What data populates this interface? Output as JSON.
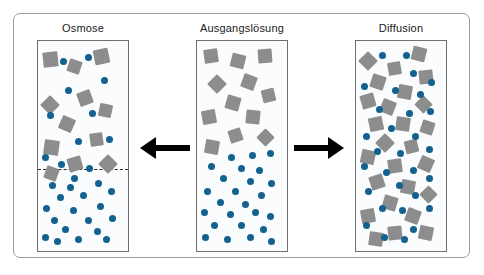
{
  "diagram": {
    "title_visible": false,
    "colors": {
      "solute_square": "#8d8d8d",
      "solvent_dot": "#12618f",
      "arrow": "#000000",
      "vessel_border": "#6f6f6f",
      "frame_border": "#9a9a9a",
      "vessel_fill": "#fbfcfd",
      "membrane": "#2b2b2b"
    },
    "panels": [
      {
        "id": "osmose",
        "label": "Osmose",
        "has_membrane": true,
        "membrane_y_pct": 61,
        "squares": [
          {
            "x": 6,
            "y": 5,
            "s": 15,
            "r": -6
          },
          {
            "x": 33,
            "y": 9,
            "s": 13,
            "r": 18
          },
          {
            "x": 62,
            "y": 4,
            "s": 15,
            "r": -12
          },
          {
            "x": 5,
            "y": 27,
            "s": 14,
            "r": 45
          },
          {
            "x": 44,
            "y": 24,
            "s": 14,
            "r": -20
          },
          {
            "x": 68,
            "y": 30,
            "s": 13,
            "r": 12
          },
          {
            "x": 24,
            "y": 36,
            "s": 14,
            "r": 24
          },
          {
            "x": 58,
            "y": 44,
            "s": 13,
            "r": -8
          },
          {
            "x": 7,
            "y": 47,
            "s": 15,
            "r": 8
          },
          {
            "x": 33,
            "y": 55,
            "s": 14,
            "r": -16
          },
          {
            "x": 70,
            "y": 55,
            "s": 14,
            "r": 45
          },
          {
            "x": 8,
            "y": 60,
            "s": 13,
            "r": 20
          }
        ],
        "dots": [
          {
            "x": 24,
            "y": 8,
            "s": 7
          },
          {
            "x": 52,
            "y": 6,
            "s": 7
          },
          {
            "x": 70,
            "y": 17,
            "s": 7
          },
          {
            "x": 30,
            "y": 22,
            "s": 7
          },
          {
            "x": 10,
            "y": 34,
            "s": 7
          },
          {
            "x": 57,
            "y": 33,
            "s": 7
          },
          {
            "x": 41,
            "y": 46,
            "s": 7
          },
          {
            "x": 76,
            "y": 45,
            "s": 7
          },
          {
            "x": 4,
            "y": 54,
            "s": 7
          },
          {
            "x": 22,
            "y": 57,
            "s": 7
          },
          {
            "x": 53,
            "y": 59,
            "s": 7
          },
          {
            "x": 37,
            "y": 64,
            "s": 7
          },
          {
            "x": 12,
            "y": 67,
            "s": 7
          },
          {
            "x": 32,
            "y": 68,
            "s": 7
          },
          {
            "x": 63,
            "y": 66,
            "s": 7
          },
          {
            "x": 78,
            "y": 70,
            "s": 7
          },
          {
            "x": 21,
            "y": 73,
            "s": 7
          },
          {
            "x": 47,
            "y": 72,
            "s": 7
          },
          {
            "x": 6,
            "y": 78,
            "s": 7
          },
          {
            "x": 36,
            "y": 79,
            "s": 7
          },
          {
            "x": 66,
            "y": 77,
            "s": 7
          },
          {
            "x": 14,
            "y": 84,
            "s": 7
          },
          {
            "x": 52,
            "y": 84,
            "s": 7
          },
          {
            "x": 79,
            "y": 83,
            "s": 7
          },
          {
            "x": 27,
            "y": 88,
            "s": 7
          },
          {
            "x": 62,
            "y": 89,
            "s": 7
          },
          {
            "x": 4,
            "y": 92,
            "s": 7
          },
          {
            "x": 41,
            "y": 93,
            "s": 7
          },
          {
            "x": 72,
            "y": 93,
            "s": 7
          },
          {
            "x": 18,
            "y": 94,
            "s": 7
          }
        ]
      },
      {
        "id": "ausgangsloesung",
        "label": "Ausgangslösung",
        "has_membrane": false,
        "membrane_y_pct": 0,
        "squares": [
          {
            "x": 8,
            "y": 4,
            "s": 14,
            "r": -8
          },
          {
            "x": 38,
            "y": 6,
            "s": 14,
            "r": 14
          },
          {
            "x": 68,
            "y": 4,
            "s": 14,
            "r": -4
          },
          {
            "x": 14,
            "y": 17,
            "s": 14,
            "r": 45
          },
          {
            "x": 50,
            "y": 16,
            "s": 14,
            "r": 20
          },
          {
            "x": 72,
            "y": 23,
            "s": 13,
            "r": -14
          },
          {
            "x": 32,
            "y": 26,
            "s": 14,
            "r": 16
          },
          {
            "x": 6,
            "y": 33,
            "s": 14,
            "r": -10
          },
          {
            "x": 54,
            "y": 33,
            "s": 14,
            "r": 6
          },
          {
            "x": 36,
            "y": 42,
            "s": 13,
            "r": -18
          },
          {
            "x": 69,
            "y": 43,
            "s": 13,
            "r": 45
          },
          {
            "x": 9,
            "y": 47,
            "s": 14,
            "r": 10
          }
        ],
        "dots": [
          {
            "x": 34,
            "y": 54,
            "s": 7
          },
          {
            "x": 58,
            "y": 53,
            "s": 7
          },
          {
            "x": 78,
            "y": 52,
            "s": 7
          },
          {
            "x": 12,
            "y": 58,
            "s": 7
          },
          {
            "x": 45,
            "y": 59,
            "s": 7
          },
          {
            "x": 66,
            "y": 60,
            "s": 7
          },
          {
            "x": 25,
            "y": 64,
            "s": 7
          },
          {
            "x": 55,
            "y": 65,
            "s": 7
          },
          {
            "x": 79,
            "y": 66,
            "s": 7
          },
          {
            "x": 8,
            "y": 70,
            "s": 7
          },
          {
            "x": 39,
            "y": 70,
            "s": 7
          },
          {
            "x": 68,
            "y": 72,
            "s": 7
          },
          {
            "x": 22,
            "y": 75,
            "s": 7
          },
          {
            "x": 50,
            "y": 76,
            "s": 7
          },
          {
            "x": 4,
            "y": 80,
            "s": 7
          },
          {
            "x": 33,
            "y": 81,
            "s": 7
          },
          {
            "x": 61,
            "y": 80,
            "s": 7
          },
          {
            "x": 78,
            "y": 82,
            "s": 7
          },
          {
            "x": 16,
            "y": 86,
            "s": 7
          },
          {
            "x": 45,
            "y": 86,
            "s": 7
          },
          {
            "x": 70,
            "y": 88,
            "s": 7
          },
          {
            "x": 6,
            "y": 92,
            "s": 7
          },
          {
            "x": 30,
            "y": 93,
            "s": 7
          },
          {
            "x": 55,
            "y": 92,
            "s": 7
          },
          {
            "x": 79,
            "y": 94,
            "s": 7
          }
        ]
      },
      {
        "id": "diffusion",
        "label": "Diffusion",
        "has_membrane": false,
        "membrane_y_pct": 0,
        "squares": [
          {
            "x": 6,
            "y": 6,
            "s": 14,
            "r": 45
          },
          {
            "x": 62,
            "y": 3,
            "s": 14,
            "r": 14
          },
          {
            "x": 36,
            "y": 10,
            "s": 13,
            "r": -10
          },
          {
            "x": 17,
            "y": 16,
            "s": 14,
            "r": 18
          },
          {
            "x": 70,
            "y": 14,
            "s": 14,
            "r": -6
          },
          {
            "x": 47,
            "y": 21,
            "s": 14,
            "r": 10
          },
          {
            "x": 6,
            "y": 25,
            "s": 14,
            "r": -16
          },
          {
            "x": 28,
            "y": 28,
            "s": 14,
            "r": 22
          },
          {
            "x": 68,
            "y": 27,
            "s": 13,
            "r": 45
          },
          {
            "x": 14,
            "y": 36,
            "s": 14,
            "r": -12
          },
          {
            "x": 44,
            "y": 36,
            "s": 14,
            "r": 8
          },
          {
            "x": 72,
            "y": 38,
            "s": 13,
            "r": 18
          },
          {
            "x": 24,
            "y": 45,
            "s": 14,
            "r": 45
          },
          {
            "x": 54,
            "y": 47,
            "s": 13,
            "r": -14
          },
          {
            "x": 6,
            "y": 52,
            "s": 14,
            "r": 12
          },
          {
            "x": 36,
            "y": 56,
            "s": 14,
            "r": -8
          },
          {
            "x": 70,
            "y": 55,
            "s": 14,
            "r": 24
          },
          {
            "x": 16,
            "y": 64,
            "s": 14,
            "r": -18
          },
          {
            "x": 50,
            "y": 66,
            "s": 14,
            "r": 10
          },
          {
            "x": 73,
            "y": 70,
            "s": 13,
            "r": 45
          },
          {
            "x": 30,
            "y": 74,
            "s": 14,
            "r": 16
          },
          {
            "x": 6,
            "y": 80,
            "s": 14,
            "r": -10
          },
          {
            "x": 56,
            "y": 80,
            "s": 14,
            "r": 20
          },
          {
            "x": 36,
            "y": 88,
            "s": 14,
            "r": -6
          },
          {
            "x": 70,
            "y": 88,
            "s": 14,
            "r": 12
          },
          {
            "x": 14,
            "y": 91,
            "s": 14,
            "r": 8
          }
        ],
        "dots": [
          {
            "x": 26,
            "y": 5,
            "s": 7
          },
          {
            "x": 52,
            "y": 5,
            "s": 7
          },
          {
            "x": 60,
            "y": 14,
            "s": 7
          },
          {
            "x": 80,
            "y": 18,
            "s": 7
          },
          {
            "x": 6,
            "y": 20,
            "s": 7
          },
          {
            "x": 40,
            "y": 22,
            "s": 7
          },
          {
            "x": 68,
            "y": 24,
            "s": 7
          },
          {
            "x": 22,
            "y": 31,
            "s": 7
          },
          {
            "x": 56,
            "y": 33,
            "s": 7
          },
          {
            "x": 79,
            "y": 32,
            "s": 7
          },
          {
            "x": 36,
            "y": 40,
            "s": 7
          },
          {
            "x": 8,
            "y": 44,
            "s": 7
          },
          {
            "x": 62,
            "y": 44,
            "s": 7
          },
          {
            "x": 20,
            "y": 51,
            "s": 7
          },
          {
            "x": 46,
            "y": 52,
            "s": 7
          },
          {
            "x": 78,
            "y": 50,
            "s": 7
          },
          {
            "x": 6,
            "y": 58,
            "s": 7
          },
          {
            "x": 30,
            "y": 61,
            "s": 7
          },
          {
            "x": 60,
            "y": 60,
            "s": 7
          },
          {
            "x": 44,
            "y": 67,
            "s": 7
          },
          {
            "x": 78,
            "y": 64,
            "s": 7
          },
          {
            "x": 10,
            "y": 70,
            "s": 7
          },
          {
            "x": 62,
            "y": 72,
            "s": 7
          },
          {
            "x": 26,
            "y": 78,
            "s": 7
          },
          {
            "x": 48,
            "y": 79,
            "s": 7
          },
          {
            "x": 78,
            "y": 78,
            "s": 7
          },
          {
            "x": 8,
            "y": 86,
            "s": 7
          },
          {
            "x": 60,
            "y": 88,
            "s": 7
          },
          {
            "x": 28,
            "y": 92,
            "s": 7
          },
          {
            "x": 50,
            "y": 93,
            "s": 7
          }
        ]
      }
    ],
    "arrows": [
      {
        "id": "arrow-left",
        "direction": "left",
        "label": ""
      },
      {
        "id": "arrow-right",
        "direction": "right",
        "label": ""
      }
    ]
  }
}
